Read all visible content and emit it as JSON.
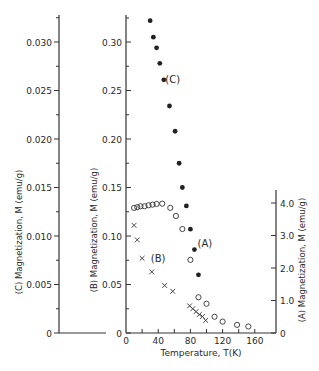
{
  "chart_data": {
    "type": "scatter",
    "title": "",
    "xlabel": "Temperature, T(K)",
    "xlim": [
      0,
      180
    ],
    "x_ticks": [
      "0",
      "40",
      "80",
      "120",
      "160"
    ],
    "axes": {
      "C": {
        "label": "(C) Magnetization, M (emu/g)",
        "position": "far-left",
        "ylim": [
          0,
          0.0325
        ],
        "ticks": [
          "0",
          "0.005",
          "0.010",
          "0.015",
          "0.020",
          "0.025",
          "0.030"
        ]
      },
      "B": {
        "label": "(B) Magnetization, M (emu/g)",
        "position": "left",
        "ylim": [
          0,
          0.325
        ],
        "ticks": [
          "0",
          "0.05",
          "0.10",
          "0.15",
          "0.20",
          "0.25",
          "0.30"
        ]
      },
      "A": {
        "label": "(A) Magnetization, M (emu/g)",
        "position": "right",
        "ylim": [
          0,
          4.0
        ],
        "ticks": [
          "0",
          "1.0",
          "2.0",
          "3.0",
          "4.0"
        ]
      }
    },
    "series": [
      {
        "name": "(C)",
        "marker": "filled-circle",
        "axis": "C",
        "x": [
          30,
          34,
          38,
          42,
          47,
          54,
          61,
          66,
          70,
          75,
          80,
          85,
          90
        ],
        "y": [
          0.0322,
          0.0305,
          0.0294,
          0.0278,
          0.0261,
          0.0234,
          0.0208,
          0.0175,
          0.015,
          0.0131,
          0.0107,
          0.0086,
          0.006
        ]
      },
      {
        "name": "(A)",
        "marker": "open-circle",
        "axis": "A",
        "x": [
          10,
          14,
          18,
          23,
          28,
          33,
          38,
          45,
          55,
          62,
          70,
          80,
          90,
          100,
          110,
          120,
          138,
          152
        ],
        "y": [
          3.85,
          3.87,
          3.9,
          3.9,
          3.93,
          3.95,
          3.97,
          3.98,
          3.85,
          3.6,
          3.2,
          2.25,
          1.1,
          0.9,
          0.5,
          0.35,
          0.25,
          0.2
        ]
      },
      {
        "name": "(B)",
        "marker": "x",
        "axis": "B",
        "x": [
          10,
          14,
          20,
          32,
          48,
          58,
          79,
          83,
          87,
          91,
          95,
          99
        ],
        "y": [
          0.111,
          0.096,
          0.077,
          0.063,
          0.049,
          0.043,
          0.028,
          0.025,
          0.022,
          0.019,
          0.017,
          0.013
        ]
      }
    ],
    "annotations": [
      {
        "text": "(C)",
        "near_x": 58,
        "near_axis": "C",
        "near_y": 0.0261
      },
      {
        "text": "(A)",
        "near_x": 98,
        "near_axis": "A",
        "near_y": 2.75
      },
      {
        "text": "(B)",
        "near_x": 40,
        "near_axis": "B",
        "near_y": 0.077
      }
    ],
    "grid": false,
    "legend": "none (inline labels)"
  }
}
